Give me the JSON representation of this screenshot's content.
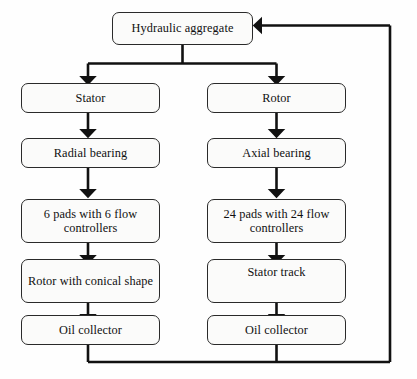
{
  "diagram": {
    "type": "flowchart",
    "title_faint_remnant": "",
    "root": {
      "label": "Hydraulic aggregate"
    },
    "columns": [
      {
        "name": "stator-branch",
        "nodes": [
          {
            "label": "Stator"
          },
          {
            "label": "Radial bearing"
          },
          {
            "label": "6 pads with 6 flow controllers"
          },
          {
            "label": "Rotor with conical shape"
          },
          {
            "label": "Oil collector"
          }
        ]
      },
      {
        "name": "rotor-branch",
        "nodes": [
          {
            "label": "Rotor"
          },
          {
            "label": "Axial bearing"
          },
          {
            "label": "24 pads with 24 flow controllers"
          },
          {
            "label": "Stator track"
          },
          {
            "label": "Oil collector"
          }
        ]
      }
    ],
    "connectors": {
      "fork_from_root": "splits to Stator and Rotor",
      "feedback_loop": "both Oil collector outputs return to Hydraulic aggregate",
      "arrow_direction_into_root": "left"
    },
    "colors": {
      "background": "#fefefe",
      "node_fill": "#fbfbfa",
      "node_border": "#2a2a2a",
      "connector": "#111111",
      "text": "#101010"
    }
  }
}
